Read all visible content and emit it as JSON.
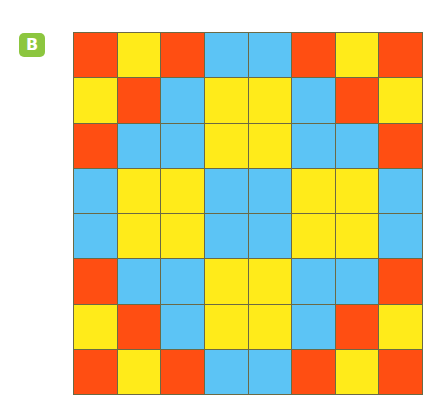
{
  "badge": {
    "label": "B",
    "color": "#8cc63f"
  },
  "palette": {
    "R": "#ff4e12",
    "Y": "#ffeb1a",
    "B": "#5cc4f5",
    "grid_line": "#6b6a45"
  },
  "grid": {
    "rows": 8,
    "cols": 8,
    "cells": [
      [
        "R",
        "Y",
        "R",
        "B",
        "B",
        "R",
        "Y",
        "R"
      ],
      [
        "Y",
        "R",
        "B",
        "Y",
        "Y",
        "B",
        "R",
        "Y"
      ],
      [
        "R",
        "B",
        "B",
        "Y",
        "Y",
        "B",
        "B",
        "R"
      ],
      [
        "B",
        "Y",
        "Y",
        "B",
        "B",
        "Y",
        "Y",
        "B"
      ],
      [
        "B",
        "Y",
        "Y",
        "B",
        "B",
        "Y",
        "Y",
        "B"
      ],
      [
        "R",
        "B",
        "B",
        "Y",
        "Y",
        "B",
        "B",
        "R"
      ],
      [
        "Y",
        "R",
        "B",
        "Y",
        "Y",
        "B",
        "R",
        "Y"
      ],
      [
        "R",
        "Y",
        "R",
        "B",
        "B",
        "R",
        "Y",
        "R"
      ]
    ]
  }
}
